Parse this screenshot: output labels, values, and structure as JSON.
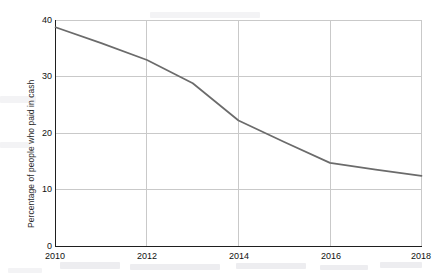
{
  "chart_data": {
    "type": "line",
    "title": "",
    "xlabel": "",
    "ylabel": "Percentage of people who paid in cash",
    "x": [
      2010,
      2011,
      2012,
      2013,
      2014,
      2015,
      2016,
      2017,
      2018
    ],
    "values": [
      38.8,
      36.0,
      33.0,
      28.9,
      22.3,
      18.5,
      14.8,
      13.6,
      12.5
    ],
    "series": [
      {
        "name": "Percentage of people who paid in cash",
        "values": [
          38.8,
          36.0,
          33.0,
          28.9,
          22.3,
          18.5,
          14.8,
          13.6,
          12.5
        ],
        "color": "#6b6b6b"
      }
    ],
    "xlim": [
      2010,
      2018
    ],
    "ylim": [
      0,
      40
    ],
    "xticks": [
      2010,
      2012,
      2014,
      2016,
      2018
    ],
    "yticks": [
      0,
      10,
      20,
      30,
      40
    ],
    "xtick_labels": [
      "2010",
      "2012",
      "2014",
      "2016",
      "2018"
    ],
    "ytick_labels": [
      "0",
      "10",
      "20",
      "30",
      "40"
    ],
    "grid": true,
    "grid_color": "#c8c8c8",
    "legend": false,
    "legend_position": "none",
    "line_color": "#6b6b6b",
    "background_color": "#ffffff",
    "axis_color": "#1a1a1a"
  },
  "axes": {
    "y_title": "Percentage of people who paid in cash",
    "y_tick_labels": [
      "40",
      "30",
      "20",
      "10",
      "0"
    ],
    "x_tick_labels": [
      "2010",
      "2012",
      "2014",
      "2016",
      "2018"
    ]
  }
}
